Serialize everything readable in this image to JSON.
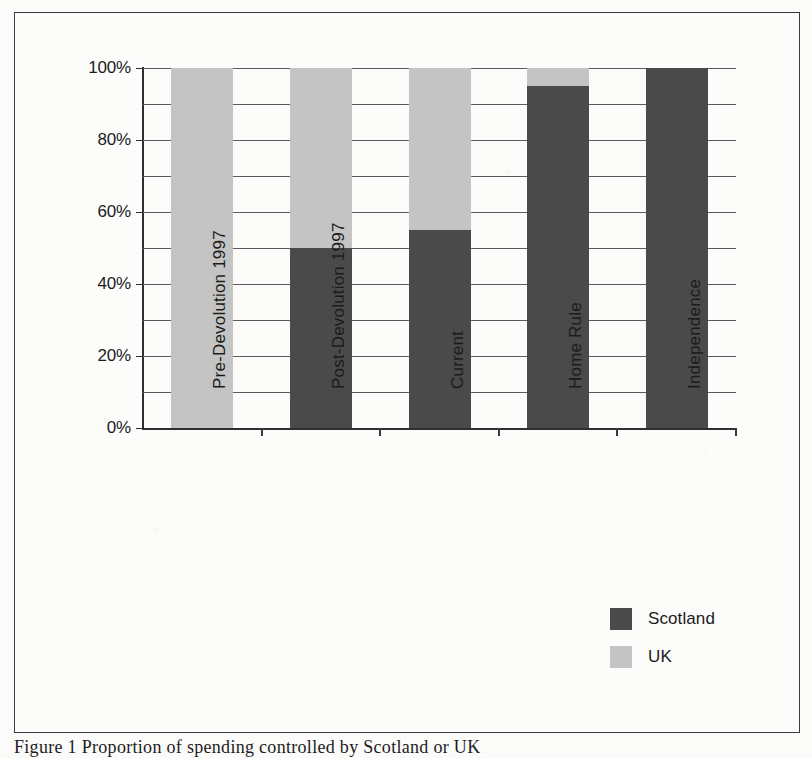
{
  "chart_data": {
    "type": "bar",
    "subtype": "stacked-100-percent",
    "title": "",
    "xlabel": "",
    "ylabel": "",
    "ylim": [
      0,
      100
    ],
    "ytick_labels": [
      "0%",
      "20%",
      "40%",
      "60%",
      "80%",
      "100%"
    ],
    "ytick_values": [
      0,
      20,
      40,
      60,
      80,
      100
    ],
    "gridline_values": [
      10,
      20,
      30,
      40,
      50,
      60,
      70,
      80,
      90,
      100
    ],
    "grid": true,
    "legend_position": "bottom-right",
    "categories": [
      "Pre-Devolution 1997",
      "Post-Devolution 1997",
      "Current",
      "Home Rule",
      "Independence"
    ],
    "series": [
      {
        "name": "Scotland",
        "color": "#4a4a4a",
        "values": [
          0,
          50,
          55,
          95,
          100
        ]
      },
      {
        "name": "UK",
        "color": "#c4c4c4",
        "values": [
          100,
          50,
          45,
          5,
          0
        ]
      }
    ]
  },
  "legend": {
    "items": [
      {
        "label": "Scotland",
        "color": "#4a4a4a"
      },
      {
        "label": "UK",
        "color": "#c4c4c4"
      }
    ]
  },
  "caption": {
    "text": "Figure 1 Proportion of spending controlled by Scotland or UK"
  }
}
